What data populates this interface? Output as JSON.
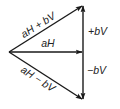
{
  "diagram": {
    "title": "",
    "colors": {
      "stroke": "#1a1a1a",
      "text": "#222222",
      "background": "#ffffff"
    },
    "nodes": {
      "origin": {
        "x": 9,
        "y": 52
      },
      "top": {
        "x": 83,
        "y": 5
      },
      "middle": {
        "x": 83,
        "y": 52
      },
      "bottom": {
        "x": 83,
        "y": 100
      }
    },
    "vectors": [
      {
        "id": "sum",
        "from": "origin",
        "to": "top",
        "label": "aH + bV"
      },
      {
        "id": "ah",
        "from": "origin",
        "to": "middle",
        "label": "aH"
      },
      {
        "id": "diff",
        "from": "origin",
        "to": "bottom",
        "label": "aH − bV"
      },
      {
        "id": "plus_bv",
        "from": "middle",
        "to": "top",
        "label": "+bV"
      },
      {
        "id": "minus_bv",
        "from": "middle",
        "to": "bottom",
        "label": "−bV"
      }
    ]
  }
}
